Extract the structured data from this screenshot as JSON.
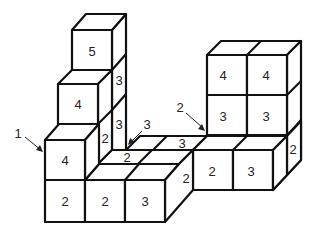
{
  "diagram": {
    "type": "isometric cube stack with height labels",
    "colors": {
      "stroke": "#111111",
      "fill": "#ffffff",
      "text": "#222222"
    },
    "cube_labels": {
      "left_tower_top": "5",
      "left_tower_upper": "4",
      "left_front_upper": "4",
      "bottom_front_1": "2",
      "bottom_front_2": "2",
      "bottom_front_3": "3",
      "back_strip_top": "3",
      "back_strip_mid": "3",
      "back_strip_low": "2",
      "inner_floor": "2",
      "inner_floor_back": "3",
      "bottom_side": "2",
      "right_back_top_1": "4",
      "right_back_top_2": "4",
      "right_back_mid_1": "3",
      "right_back_mid_2": "3",
      "right_front_1": "2",
      "right_front_2": "3",
      "right_side": "2"
    },
    "callouts": [
      {
        "id": "callout-1",
        "label": "1"
      },
      {
        "id": "callout-2",
        "label": "2"
      },
      {
        "id": "callout-3",
        "label": "3"
      }
    ]
  }
}
